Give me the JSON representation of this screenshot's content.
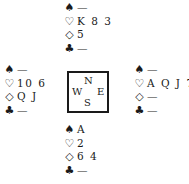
{
  "diagram": {
    "type": "bridge-deal",
    "suit_symbols": {
      "spades": "♠",
      "hearts": "♡",
      "diamonds": "◇",
      "clubs": "♣"
    },
    "compass": {
      "north": "N",
      "south": "S",
      "east": "E",
      "west": "W"
    },
    "hands": {
      "north": {
        "spades": "—",
        "hearts": "K 8 3",
        "diamonds": "5",
        "clubs": "—"
      },
      "west": {
        "spades": "—",
        "hearts": "10 6",
        "diamonds": "Q J",
        "clubs": "—"
      },
      "east": {
        "spades": "—",
        "hearts": "A Q J 7",
        "diamonds": "—",
        "clubs": "—"
      },
      "south": {
        "spades": "A",
        "hearts": "2",
        "diamonds": "6 4",
        "clubs": "—"
      }
    }
  }
}
